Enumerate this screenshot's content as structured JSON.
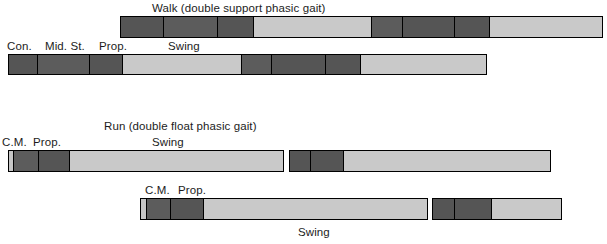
{
  "figure": {
    "background": "#ffffff",
    "colors": {
      "dark": "#555555",
      "dark_alt": "#5c5c5c",
      "light": "#c6c6c6",
      "light_alt": "#c9c9c9",
      "border": "#000000",
      "text": "#1c1c1c"
    }
  },
  "walk": {
    "title": "Walk (double support phasic gait)",
    "phase_labels": {
      "contact": "Con.",
      "mid_stance": "Mid. St.",
      "propulsion": "Prop.",
      "swing": "Swing"
    },
    "bar_top": {
      "segments": [
        {
          "name": "contact",
          "tone": "dark",
          "width": 44
        },
        {
          "name": "mid-stance",
          "tone": "dark",
          "width": 55
        },
        {
          "name": "propulsion",
          "tone": "dark",
          "width": 37
        },
        {
          "name": "swing",
          "tone": "light",
          "width": 119
        },
        {
          "name": "contact",
          "tone": "dark",
          "width": 32
        },
        {
          "name": "mid-stance",
          "tone": "dark",
          "width": 53
        },
        {
          "name": "propulsion",
          "tone": "dark",
          "width": 36
        },
        {
          "name": "swing",
          "tone": "light",
          "width": 114
        }
      ]
    },
    "bar_bottom": {
      "segments": [
        {
          "name": "contact",
          "tone": "dark",
          "width": 30
        },
        {
          "name": "mid-stance",
          "tone": "dark",
          "width": 52
        },
        {
          "name": "propulsion",
          "tone": "dark",
          "width": 34
        },
        {
          "name": "swing",
          "tone": "light",
          "width": 118
        },
        {
          "name": "contact",
          "tone": "dark",
          "width": 31
        },
        {
          "name": "mid-stance",
          "tone": "dark",
          "width": 54
        },
        {
          "name": "propulsion",
          "tone": "dark",
          "width": 36
        },
        {
          "name": "swing",
          "tone": "light",
          "width": 125
        }
      ]
    }
  },
  "run": {
    "title": "Run (double float phasic gait)",
    "phase_labels": {
      "contact_mid": "C.M.",
      "propulsion": "Prop.",
      "swing": "Swing"
    },
    "bar_top": {
      "segments": [
        {
          "name": "float",
          "tone": "light",
          "width": 6
        },
        {
          "name": "contact-mid",
          "tone": "dark",
          "width": 26
        },
        {
          "name": "propulsion",
          "tone": "dark",
          "width": 33
        },
        {
          "name": "swing",
          "tone": "light",
          "width": 218
        },
        {
          "name": "float-gap",
          "tone": "gap",
          "width": 5
        },
        {
          "name": "contact-mid",
          "tone": "dark",
          "width": 22
        },
        {
          "name": "propulsion",
          "tone": "dark",
          "width": 35
        },
        {
          "name": "swing",
          "tone": "light",
          "width": 211
        }
      ]
    },
    "bar_bottom": {
      "segments": [
        {
          "name": "float",
          "tone": "light",
          "width": 7
        },
        {
          "name": "contact-mid",
          "tone": "dark",
          "width": 25
        },
        {
          "name": "propulsion",
          "tone": "dark",
          "width": 35
        },
        {
          "name": "swing",
          "tone": "light",
          "width": 228
        },
        {
          "name": "float-gap",
          "tone": "gap",
          "width": 4
        },
        {
          "name": "contact-mid",
          "tone": "dark",
          "width": 24
        },
        {
          "name": "propulsion",
          "tone": "dark",
          "width": 38
        },
        {
          "name": "swing",
          "tone": "light",
          "width": 72
        }
      ]
    },
    "swing_label_top": "Swing",
    "swing_label_bottom": "Swing"
  }
}
